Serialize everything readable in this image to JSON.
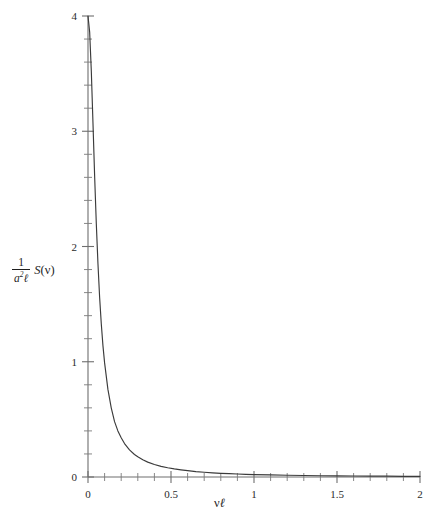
{
  "figure": {
    "background_color": "#ffffff",
    "curve_color": "#3b3b3b",
    "axis_color": "#6e6e6e"
  },
  "axis_titles": {
    "x": {
      "full": "νℓ",
      "variable": "ν",
      "length_symbol": "ℓ"
    },
    "y": {
      "full": "1/(a²ℓ) S(ν)",
      "numerator": "1",
      "denominator_base": "a",
      "denominator_exponent": "2",
      "denominator_symbol": "ℓ",
      "function_name": "S",
      "open_paren": "(",
      "function_argument": "ν",
      "close_paren": ")"
    }
  },
  "chart_data": {
    "type": "line",
    "title": "",
    "subtitle": "",
    "xlabel": "νℓ",
    "ylabel": "1/(a²ℓ) S(ν)",
    "xlim": [
      0,
      2
    ],
    "ylim": [
      0,
      4
    ],
    "grid": false,
    "legend": null,
    "legend_position": "none",
    "x_major_ticks": [
      0,
      0.5,
      1,
      1.5,
      2
    ],
    "x_major_tick_labels": [
      "0",
      "0.5",
      "1",
      "1.5",
      "2"
    ],
    "x_minor_tick_step": 0.1,
    "y_major_ticks": [
      0,
      1,
      2,
      3,
      4
    ],
    "y_major_tick_labels": [
      "0",
      "1",
      "2",
      "3",
      "4"
    ],
    "y_minor_tick_step": 0.2,
    "series": [
      {
        "name": "S(ν)/(a²ℓ)",
        "x": [
          0.0,
          0.01,
          0.02,
          0.03,
          0.04,
          0.05,
          0.06,
          0.07,
          0.08,
          0.09,
          0.1,
          0.12,
          0.14,
          0.16,
          0.18,
          0.2,
          0.22,
          0.25,
          0.28,
          0.3,
          0.33,
          0.36,
          0.4,
          0.44,
          0.48,
          0.52,
          0.56,
          0.6,
          0.65,
          0.7,
          0.75,
          0.8,
          0.85,
          0.9,
          0.95,
          1.0,
          1.1,
          1.2,
          1.3,
          1.4,
          1.5,
          1.6,
          1.7,
          1.8,
          1.9,
          2.0
        ],
        "y": [
          4.0,
          3.86,
          3.52,
          3.07,
          2.61,
          2.2,
          1.85,
          1.56,
          1.33,
          1.14,
          0.99,
          0.76,
          0.6,
          0.48,
          0.4,
          0.34,
          0.29,
          0.235,
          0.195,
          0.175,
          0.149,
          0.129,
          0.108,
          0.092,
          0.08,
          0.07,
          0.062,
          0.055,
          0.047,
          0.041,
          0.036,
          0.032,
          0.029,
          0.026,
          0.023,
          0.021,
          0.018,
          0.015,
          0.013,
          0.011,
          0.01,
          0.009,
          0.008,
          0.007,
          0.006,
          0.006
        ]
      }
    ],
    "peak": {
      "x": 0.0,
      "y": 4.0
    }
  }
}
